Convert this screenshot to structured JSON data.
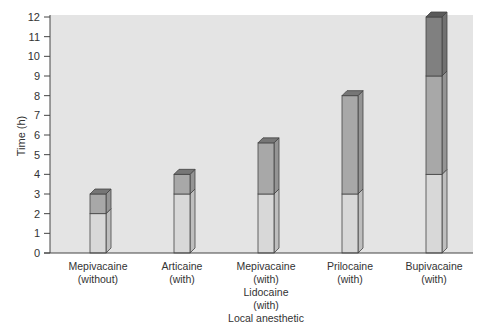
{
  "chart_data": {
    "type": "bar",
    "stacked": true,
    "title": "",
    "xlabel": "",
    "ylabel": "Time (h)",
    "ylim": [
      0,
      12
    ],
    "yticks": [
      0,
      1,
      2,
      3,
      4,
      5,
      6,
      7,
      8,
      9,
      10,
      11,
      12
    ],
    "grid": false,
    "legend": null,
    "categories": [
      "Mepivacaine\n(without)",
      "Articaine\n(with)",
      "Mepivacaine\n(with)\nLidocaine\n(with)\nLocal anesthetic",
      "Prilocaine\n(with)",
      "Bupivacaine\n(with)"
    ],
    "series": [
      {
        "name": "segment-1 (light)",
        "color": "#d8d8d8",
        "values": [
          2,
          3,
          3,
          3,
          4
        ]
      },
      {
        "name": "segment-2 (medium)",
        "color": "#a8a8a8",
        "values": [
          1,
          1,
          2.6,
          5,
          5
        ]
      },
      {
        "name": "segment-3 (dark)",
        "color": "#808080",
        "values": [
          0,
          0,
          0,
          0,
          3
        ]
      }
    ],
    "totals": [
      3,
      4,
      5.6,
      8,
      12
    ]
  },
  "colors": {
    "plot_background": "#e4e4e4",
    "page_background": "#ffffff",
    "outline": "#444444"
  }
}
